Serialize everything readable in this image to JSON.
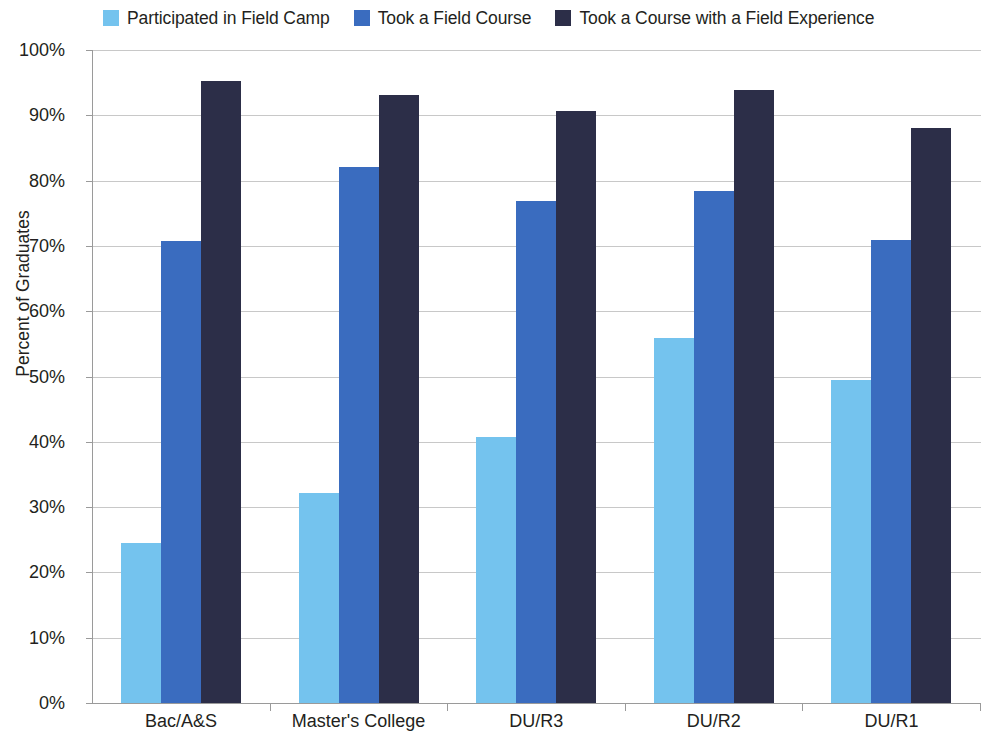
{
  "legend": {
    "entries": [
      {
        "label": "Participated in Field Camp",
        "color": "#74c3ee"
      },
      {
        "label": "Took a Field Course",
        "color": "#3a6cbf"
      },
      {
        "label": "Took a Course with a Field Experience",
        "color": "#2c2e48"
      }
    ]
  },
  "axes": {
    "y_title": "Percent of Graduates",
    "y_ticks": [
      "0%",
      "10%",
      "20%",
      "30%",
      "40%",
      "50%",
      "60%",
      "70%",
      "80%",
      "90%",
      "100%"
    ],
    "x_labels": [
      "Bac/A&S",
      "Master's College",
      "DU/R3",
      "DU/R2",
      "DU/R1"
    ]
  },
  "chart_data": {
    "type": "bar",
    "title": "",
    "xlabel": "",
    "ylabel": "Percent of Graduates",
    "ylim": [
      0,
      100
    ],
    "ytick_step": 10,
    "grid": true,
    "legend_position": "top",
    "categories": [
      "Bac/A&S",
      "Master's College",
      "DU/R3",
      "DU/R2",
      "DU/R1"
    ],
    "series": [
      {
        "name": "Participated in Field Camp",
        "color": "#74c3ee",
        "values": [
          24.5,
          32.2,
          40.7,
          55.9,
          49.4
        ]
      },
      {
        "name": "Took a Field Course",
        "color": "#3a6cbf",
        "values": [
          70.8,
          82.1,
          76.9,
          78.4,
          70.9
        ]
      },
      {
        "name": "Took a Course with a Field Experience",
        "color": "#2c2e48",
        "values": [
          95.3,
          93.1,
          90.6,
          93.9,
          88.0
        ]
      }
    ]
  }
}
